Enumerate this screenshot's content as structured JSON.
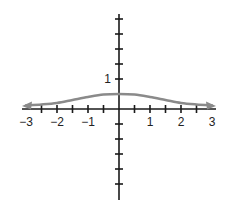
{
  "chart_data": {
    "type": "line",
    "title": "",
    "xlabel": "",
    "ylabel": "",
    "xlim": [
      -3,
      3
    ],
    "ylim": [
      -2.5,
      3.5
    ],
    "grid": false,
    "legend": null,
    "x_tick_labels": [
      "-3",
      "-2",
      "-1",
      "1",
      "2",
      "3"
    ],
    "x_tick_label_values": [
      -3,
      -2,
      -1,
      1,
      2,
      3
    ],
    "x_minor_tick_step": 0.5,
    "y_tick_labels": [
      "1"
    ],
    "y_tick_label_values": [
      1
    ],
    "y_minor_tick_step": 0.5,
    "series": [
      {
        "name": "f(x)",
        "color": "#8a8a8a",
        "arrows_both_ends": true,
        "x": [
          -3.0,
          -2.5,
          -2.0,
          -1.5,
          -1.0,
          -0.5,
          0.0,
          0.5,
          1.0,
          1.5,
          2.0,
          2.5,
          3.0
        ],
        "y": [
          0.12,
          0.15,
          0.2,
          0.3,
          0.4,
          0.48,
          0.5,
          0.48,
          0.4,
          0.3,
          0.2,
          0.15,
          0.12
        ]
      }
    ],
    "colors": {
      "axes": "#1a1a1a",
      "curve": "#8a8a8a"
    }
  }
}
